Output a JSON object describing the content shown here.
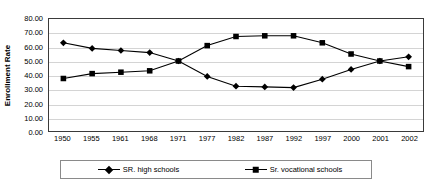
{
  "chart_data": {
    "type": "line",
    "title": "",
    "subtitle": "",
    "xlabel": "",
    "ylabel": "Enrollment Rate",
    "categories": [
      "1950",
      "1955",
      "1961",
      "1968",
      "1971",
      "1977",
      "1982",
      "1987",
      "1992",
      "1997",
      "2000",
      "2001",
      "2002"
    ],
    "ylim": [
      0,
      80
    ],
    "ytick_step": 10,
    "ytick_labels": [
      "80.00",
      "70.00",
      "60.00",
      "50.00",
      "40.00",
      "30.00",
      "20.00",
      "10.00",
      "0.00"
    ],
    "ytick_values": [
      80,
      70,
      60,
      50,
      40,
      30,
      20,
      10,
      0
    ],
    "grid": true,
    "grid_axis": "y",
    "legend_position": "bottom",
    "series": [
      {
        "name": "SR. high schools",
        "marker": "diamond",
        "color": "#000000",
        "values": [
          63.0,
          59.0,
          57.5,
          56.0,
          50.0,
          39.0,
          32.0,
          31.5,
          31.0,
          37.0,
          44.0,
          50.0,
          53.0
        ]
      },
      {
        "name": "Sr. vocational schools",
        "marker": "square",
        "color": "#000000",
        "values": [
          37.5,
          41.0,
          42.0,
          43.0,
          50.0,
          61.0,
          67.5,
          68.0,
          68.0,
          63.0,
          55.0,
          50.0,
          46.0
        ]
      }
    ]
  },
  "legend": {
    "entries": [
      {
        "label": "SR. high schools",
        "marker": "diamond"
      },
      {
        "label": "Sr. vocational schools",
        "marker": "square"
      }
    ]
  },
  "colors": {
    "series": "#000000",
    "gridline": "#d4d4d4",
    "plot_border": "#3a3a3a",
    "legend_border": "#8a8a8a",
    "background": "#ffffff"
  }
}
